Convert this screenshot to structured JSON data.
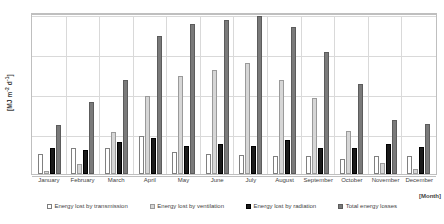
{
  "chart_data": {
    "type": "bar",
    "title": "",
    "xlabel": "[Month]",
    "ylabel": "[MJ m-2 d-1]",
    "ylabel_parts": {
      "prefix": "[MJ m",
      "sup1": "-2",
      "mid": " d",
      "sup2": "-1",
      "suffix": "]"
    },
    "ylim": [
      0,
      20
    ],
    "yticks": [
      0,
      5,
      10,
      15,
      20
    ],
    "ytick_labels": [
      "0",
      "5",
      "10",
      "15",
      "20"
    ],
    "grid": true,
    "legend_position": "bottom",
    "categories": [
      "January",
      "February",
      "March",
      "April",
      "May",
      "June",
      "July",
      "August",
      "September",
      "October",
      "November",
      "December"
    ],
    "series": [
      {
        "name": "Energy lost by transmission",
        "style": "s0",
        "values": [
          2.5,
          3.2,
          3.3,
          4.8,
          2.7,
          2.5,
          2.4,
          2.2,
          2.2,
          1.9,
          2.3,
          2.2
        ]
      },
      {
        "name": "Energy lost by ventilation",
        "style": "s1",
        "values": [
          0.4,
          1.2,
          5.3,
          9.8,
          12.2,
          13.0,
          13.9,
          11.8,
          9.5,
          5.4,
          1.4,
          0.6
        ]
      },
      {
        "name": "Energy lost by radiation",
        "style": "s2",
        "values": [
          3.3,
          3.0,
          4.0,
          4.5,
          3.5,
          3.7,
          3.5,
          4.3,
          3.3,
          3.2,
          3.8,
          3.4
        ]
      },
      {
        "name": "Total energy losses",
        "style": "s3",
        "values": [
          6.1,
          9.0,
          11.8,
          17.3,
          18.8,
          19.2,
          19.8,
          18.4,
          15.2,
          11.2,
          6.7,
          6.2
        ]
      }
    ]
  }
}
